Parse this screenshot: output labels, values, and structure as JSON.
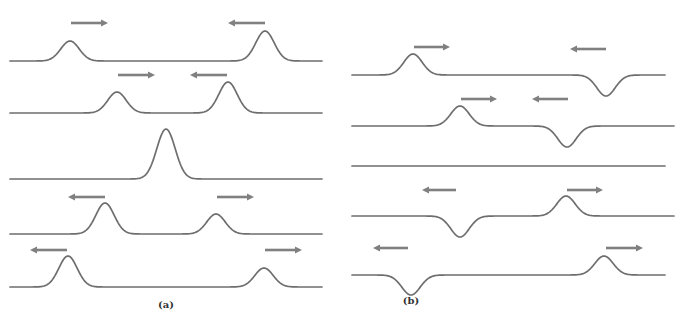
{
  "colors": {
    "curve": "#6e6e6e",
    "arrow": "#808080",
    "label": "#333333"
  },
  "diagram": {
    "panels": [
      {
        "id": "a",
        "label": "(a)",
        "label_pos": [
          166,
          309
        ],
        "rows": [
          {
            "x0": 10,
            "x1": 322,
            "y": 61,
            "pulses": [
              {
                "x": 70,
                "amp": 20,
                "w": 13
              },
              {
                "x": 265,
                "amp": 30,
                "w": 13
              }
            ],
            "arrows": [
              {
                "x1": 71,
                "x2": 108,
                "y": 23,
                "dir": "right"
              },
              {
                "x1": 228,
                "x2": 265,
                "y": 23,
                "dir": "left"
              }
            ]
          },
          {
            "x0": 10,
            "x1": 322,
            "y": 113,
            "pulses": [
              {
                "x": 117,
                "amp": 21,
                "w": 13
              },
              {
                "x": 228,
                "amp": 31,
                "w": 13
              }
            ],
            "arrows": [
              {
                "x1": 118,
                "x2": 155,
                "y": 75,
                "dir": "right"
              },
              {
                "x1": 190,
                "x2": 227,
                "y": 75,
                "dir": "left"
              }
            ]
          },
          {
            "x0": 10,
            "x1": 322,
            "y": 179,
            "pulses": [
              {
                "x": 166,
                "amp": 50,
                "w": 13
              }
            ],
            "arrows": []
          },
          {
            "x0": 10,
            "x1": 322,
            "y": 234,
            "pulses": [
              {
                "x": 105,
                "amp": 31,
                "w": 13
              },
              {
                "x": 216,
                "amp": 20,
                "w": 13
              }
            ],
            "arrows": [
              {
                "x1": 68,
                "x2": 105,
                "y": 197,
                "dir": "left"
              },
              {
                "x1": 217,
                "x2": 254,
                "y": 197,
                "dir": "right"
              }
            ]
          },
          {
            "x0": 10,
            "x1": 322,
            "y": 287,
            "pulses": [
              {
                "x": 68,
                "amp": 31,
                "w": 13
              },
              {
                "x": 264,
                "amp": 19,
                "w": 13
              }
            ],
            "arrows": [
              {
                "x1": 30,
                "x2": 67,
                "y": 250,
                "dir": "left"
              },
              {
                "x1": 265,
                "x2": 302,
                "y": 250,
                "dir": "right"
              }
            ]
          }
        ]
      },
      {
        "id": "b",
        "label": "(b)",
        "label_pos": [
          411,
          305
        ],
        "rows": [
          {
            "x0": 352,
            "x1": 665,
            "y": 75,
            "pulses": [
              {
                "x": 413,
                "amp": 21,
                "w": 13
              },
              {
                "x": 606,
                "amp": -21,
                "w": 13
              }
            ],
            "arrows": [
              {
                "x1": 414,
                "x2": 450,
                "y": 47,
                "dir": "right"
              },
              {
                "x1": 570,
                "x2": 606,
                "y": 49,
                "dir": "left"
              }
            ]
          },
          {
            "x0": 352,
            "x1": 674,
            "y": 126,
            "pulses": [
              {
                "x": 460,
                "amp": 20,
                "w": 13
              },
              {
                "x": 567,
                "amp": -21,
                "w": 13
              }
            ],
            "arrows": [
              {
                "x1": 461,
                "x2": 497,
                "y": 99,
                "dir": "right"
              },
              {
                "x1": 532,
                "x2": 568,
                "y": 99,
                "dir": "left"
              }
            ]
          },
          {
            "x0": 352,
            "x1": 665,
            "y": 166,
            "pulses": [],
            "arrows": []
          },
          {
            "x0": 352,
            "x1": 674,
            "y": 216,
            "pulses": [
              {
                "x": 460,
                "amp": -21,
                "w": 13
              },
              {
                "x": 566,
                "amp": 20,
                "w": 13
              }
            ],
            "arrows": [
              {
                "x1": 422,
                "x2": 456,
                "y": 190,
                "dir": "left"
              },
              {
                "x1": 567,
                "x2": 603,
                "y": 190,
                "dir": "right"
              }
            ]
          },
          {
            "x0": 352,
            "x1": 665,
            "y": 275,
            "pulses": [
              {
                "x": 411,
                "amp": -20,
                "w": 13
              },
              {
                "x": 604,
                "amp": 19,
                "w": 13
              }
            ],
            "arrows": [
              {
                "x1": 373,
                "x2": 408,
                "y": 248,
                "dir": "left"
              },
              {
                "x1": 606,
                "x2": 643,
                "y": 248,
                "dir": "right"
              }
            ]
          }
        ]
      }
    ]
  }
}
